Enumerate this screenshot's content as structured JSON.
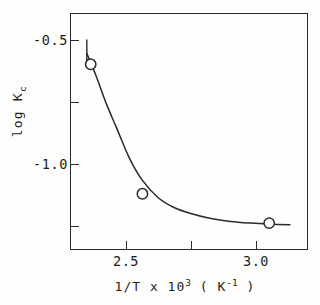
{
  "figure": {
    "background_color": "#fdfdfc",
    "ink_color": "#2a2a2a"
  },
  "axes": {
    "y_ticks": [
      {
        "label": "-0.5",
        "value": -0.5,
        "labeled": true
      },
      {
        "label": "",
        "value": -0.75,
        "labeled": false
      },
      {
        "label": "-1.0",
        "value": -1.0,
        "labeled": true
      },
      {
        "label": "",
        "value": -1.25,
        "labeled": false
      }
    ],
    "x_ticks": [
      {
        "label": "2.5",
        "value": 2.5,
        "labeled": true
      },
      {
        "label": "",
        "value": 2.75,
        "labeled": false
      },
      {
        "label": "3.0",
        "value": 3.0,
        "labeled": true
      }
    ],
    "y_title_main": "log K",
    "y_title_sub": "c",
    "x_title_a": "1/T x 10",
    "x_title_exp": "3",
    "x_title_b": " ( K",
    "x_title_exp2": "-1",
    "x_title_c": " )"
  },
  "chart_data": {
    "type": "scatter",
    "title": "",
    "subtitle": "",
    "xlabel": "1/T x 10^3 ( K^-1 )",
    "ylabel": "log Kc",
    "xlim": [
      2.32,
      3.24
    ],
    "ylim": [
      -1.36,
      -0.39
    ],
    "grid": false,
    "legend": null,
    "x_tick_values": [
      2.5,
      2.75,
      3.0
    ],
    "x_tick_labels": [
      "2.5",
      "",
      "3.0"
    ],
    "y_tick_values": [
      -0.5,
      -0.75,
      -1.0,
      -1.25
    ],
    "y_tick_labels": [
      "-0.5",
      "",
      "-1.0",
      ""
    ],
    "marker": "open-circle",
    "series": [
      {
        "name": "log Kc vs 1/T",
        "x": [
          2.4,
          2.6,
          3.09
        ],
        "y": [
          -0.6,
          -1.13,
          -1.25
        ]
      }
    ],
    "fit_curve": {
      "type": "smooth-decay",
      "description": "smooth monotonically decreasing curve through the three points, steep at low 1/T and flattening toward high 1/T",
      "x": [
        2.385,
        2.42,
        2.46,
        2.5,
        2.55,
        2.6,
        2.66,
        2.72,
        2.79,
        2.86,
        2.94,
        3.02,
        3.09,
        3.17
      ],
      "y": [
        -0.555,
        -0.645,
        -0.76,
        -0.86,
        -0.985,
        -1.075,
        -1.145,
        -1.185,
        -1.212,
        -1.23,
        -1.243,
        -1.25,
        -1.254,
        -1.257
      ]
    },
    "error_bars": [
      {
        "x": 2.385,
        "y_top": -0.5,
        "y_bottom": -0.6,
        "note": "short vertical tail above first point"
      }
    ]
  }
}
